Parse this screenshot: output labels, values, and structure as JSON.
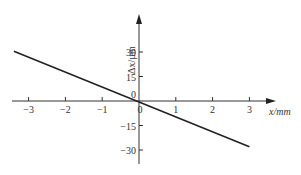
{
  "chart_data": {
    "type": "line",
    "title": "",
    "xlabel": "x/mm",
    "ylabel": "Δx/µm",
    "x_ticks": [
      "-3",
      "-2",
      "-1",
      "0",
      "1",
      "2",
      "3"
    ],
    "y_ticks": [
      "30",
      "15",
      "0",
      "-15",
      "-30"
    ],
    "xlim": [
      -3.4,
      3.7
    ],
    "ylim": [
      -38,
      52
    ],
    "grid": false,
    "legend": null,
    "series": [
      {
        "name": "Δx vs x",
        "x": [
          -3.4,
          3.0
        ],
        "y": [
          30.5,
          -28.0
        ],
        "color": "#222222"
      }
    ]
  },
  "labels": {
    "x_axis": "x/mm",
    "y_axis": "Δx/µm",
    "origin_x": "0",
    "origin_y": "0"
  }
}
